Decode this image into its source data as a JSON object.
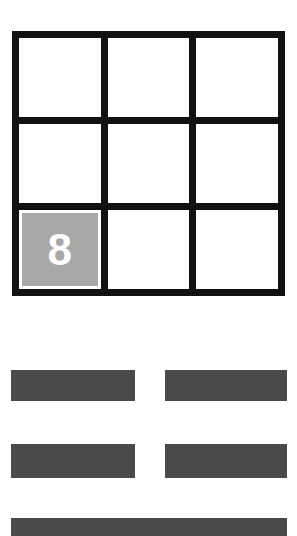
{
  "canvas": {
    "width": 297,
    "height": 536,
    "background": "#ffffff"
  },
  "colors": {
    "grid_line": "#111111",
    "cell_background": "#ffffff",
    "highlight_fill": "#a8a8a8",
    "highlight_text": "#ffffff",
    "bar_fill": "#4a4a4a"
  },
  "grid": {
    "rows": 3,
    "columns": 3,
    "cells": [
      {
        "row": 0,
        "col": 0,
        "value": "",
        "highlighted": false
      },
      {
        "row": 0,
        "col": 1,
        "value": "",
        "highlighted": false
      },
      {
        "row": 0,
        "col": 2,
        "value": "",
        "highlighted": false
      },
      {
        "row": 1,
        "col": 0,
        "value": "",
        "highlighted": false
      },
      {
        "row": 1,
        "col": 1,
        "value": "",
        "highlighted": false
      },
      {
        "row": 1,
        "col": 2,
        "value": "",
        "highlighted": false
      },
      {
        "row": 2,
        "col": 0,
        "value": "8",
        "highlighted": true
      },
      {
        "row": 2,
        "col": 1,
        "value": "",
        "highlighted": false
      },
      {
        "row": 2,
        "col": 2,
        "value": "",
        "highlighted": false
      }
    ]
  },
  "bars": [
    {
      "id": "bar-row1-left",
      "label": ""
    },
    {
      "id": "bar-row1-right",
      "label": ""
    },
    {
      "id": "bar-row2-left",
      "label": ""
    },
    {
      "id": "bar-row2-right",
      "label": ""
    },
    {
      "id": "bar-wide",
      "label": ""
    }
  ]
}
